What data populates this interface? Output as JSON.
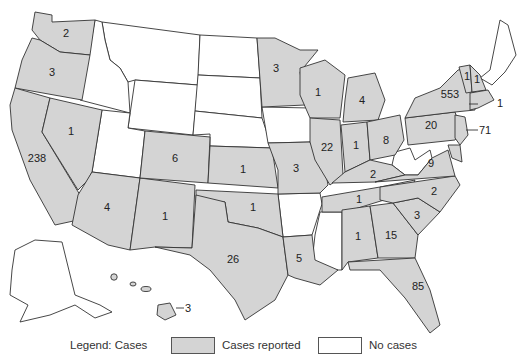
{
  "colors": {
    "cases": "#d4d4d4",
    "no_cases": "#ffffff",
    "stroke": "#333333"
  },
  "legend": {
    "title": "Legend: Cases",
    "items": [
      {
        "label": "Cases reported",
        "color": "#d4d4d4"
      },
      {
        "label": "No cases",
        "color": "#ffffff"
      }
    ]
  },
  "states": {
    "WA": "2",
    "OR": "3",
    "CA": "238",
    "NV": "1",
    "AZ": "4",
    "NM": "1",
    "CO": "6",
    "KS": "1",
    "OK": "1",
    "TX": "26",
    "MN": "3",
    "MO": "3",
    "LA": "5",
    "WI": "1",
    "IL": "22",
    "MI": "4",
    "IN": "1",
    "OH": "8",
    "KY": "2",
    "TN": "1",
    "MS": "",
    "AL": "1",
    "GA": "15",
    "FL": "85",
    "SC": "3",
    "NC": "2",
    "VA": "9",
    "PA": "20",
    "NY": "553",
    "VT": "1",
    "NH": "1",
    "MA": "1",
    "NJ": "71",
    "HI": "3"
  }
}
